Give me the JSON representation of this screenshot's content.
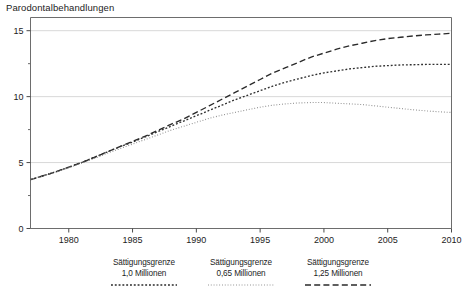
{
  "chart_data": {
    "type": "line",
    "title": "Parodontalbehandlungen",
    "xlabel": "Jahr",
    "ylabel": "",
    "xlim": [
      1977,
      2010
    ],
    "ylim": [
      0,
      16
    ],
    "grid": true,
    "legend_position": "below",
    "y_ticks": [
      0,
      5,
      10,
      15
    ],
    "y_minor_ticks": [
      2.5,
      7.5,
      12.5
    ],
    "x_ticks": [
      1980,
      1985,
      1990,
      1995,
      2000,
      2005,
      2010
    ],
    "x": [
      1977,
      1978,
      1979,
      1980,
      1981,
      1982,
      1983,
      1984,
      1985,
      1986,
      1987,
      1988,
      1989,
      1990,
      1991,
      1992,
      1993,
      1994,
      1995,
      1996,
      1997,
      1998,
      1999,
      2000,
      2001,
      2002,
      2003,
      2004,
      2005,
      2006,
      2007,
      2008,
      2009,
      2010
    ],
    "series": [
      {
        "name": "Sättigungsgrenze 1,25 Millionen",
        "style": "dashed",
        "color": "#2a2a2a",
        "values": [
          3.7,
          4.0,
          4.3,
          4.65,
          5.0,
          5.4,
          5.8,
          6.2,
          6.6,
          7.0,
          7.45,
          7.9,
          8.3,
          8.8,
          9.3,
          9.8,
          10.3,
          10.8,
          11.3,
          11.8,
          12.2,
          12.6,
          13.0,
          13.3,
          13.6,
          13.85,
          14.05,
          14.25,
          14.4,
          14.5,
          14.6,
          14.68,
          14.74,
          14.8
        ]
      },
      {
        "name": "Sättigungsgrenze 1,0 Millionen",
        "style": "dotted-medium",
        "color": "#303030",
        "values": [
          3.7,
          4.0,
          4.3,
          4.65,
          5.0,
          5.4,
          5.8,
          6.2,
          6.55,
          6.95,
          7.35,
          7.75,
          8.15,
          8.55,
          8.95,
          9.35,
          9.75,
          10.1,
          10.45,
          10.8,
          11.1,
          11.35,
          11.6,
          11.8,
          11.95,
          12.1,
          12.2,
          12.3,
          12.35,
          12.4,
          12.42,
          12.44,
          12.45,
          12.45
        ]
      },
      {
        "name": "Sättigungsgrenze 0,65 Millionen",
        "style": "dotted-fine",
        "color": "#8a8a8a",
        "values": [
          3.7,
          4.0,
          4.3,
          4.6,
          4.95,
          5.3,
          5.7,
          6.05,
          6.4,
          6.75,
          7.1,
          7.45,
          7.75,
          8.05,
          8.35,
          8.6,
          8.8,
          9.0,
          9.2,
          9.35,
          9.45,
          9.52,
          9.55,
          9.55,
          9.5,
          9.45,
          9.4,
          9.3,
          9.2,
          9.1,
          9.0,
          8.92,
          8.85,
          8.8
        ]
      }
    ]
  },
  "legend": {
    "items": [
      {
        "line1": "Sättigungsgrenze",
        "line2": "1,0 Millionen",
        "style": "dotted-medium"
      },
      {
        "line1": "Sättigungsgrenze",
        "line2": "0,65 Millionen",
        "style": "dotted-fine"
      },
      {
        "line1": "Sättigungsgrenze",
        "line2": "1,25 Millionen",
        "style": "dashed"
      }
    ]
  }
}
